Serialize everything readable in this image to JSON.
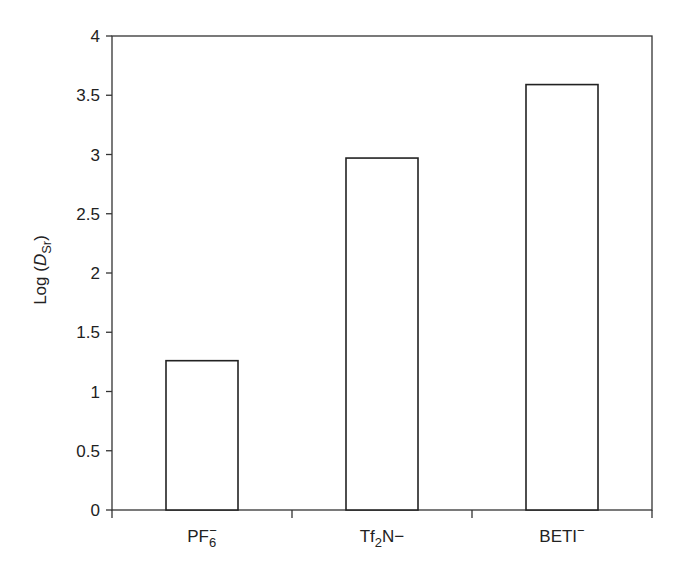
{
  "chart_data": {
    "type": "bar",
    "title": "",
    "xlabel": "",
    "ylabel": "Log (D_Sr)",
    "ylabel_parts": {
      "prefix": "Log (",
      "italic": "D",
      "sub": "Sr",
      "suffix": ")"
    },
    "categories": [
      "PF6−",
      "Tf2N−",
      "BETI−"
    ],
    "category_parts": [
      {
        "main": "PF",
        "sub": "6",
        "sup": "−",
        "after": ""
      },
      {
        "main": "Tf",
        "sub": "2",
        "sup": "",
        "after": "N−"
      },
      {
        "main": "BETI",
        "sub": "",
        "sup": "−",
        "after": ""
      }
    ],
    "values": [
      1.26,
      2.97,
      3.59
    ],
    "ylim": [
      0,
      4
    ],
    "yticks": [
      0,
      0.5,
      1,
      1.5,
      2,
      2.5,
      3,
      3.5,
      4
    ],
    "ytick_labels": [
      "0",
      "0.5",
      "1",
      "1.5",
      "2",
      "2.5",
      "3",
      "3.5",
      "4"
    ],
    "grid": false,
    "legend": null,
    "bar_fill": "#ffffff",
    "bar_stroke": "#222222"
  }
}
